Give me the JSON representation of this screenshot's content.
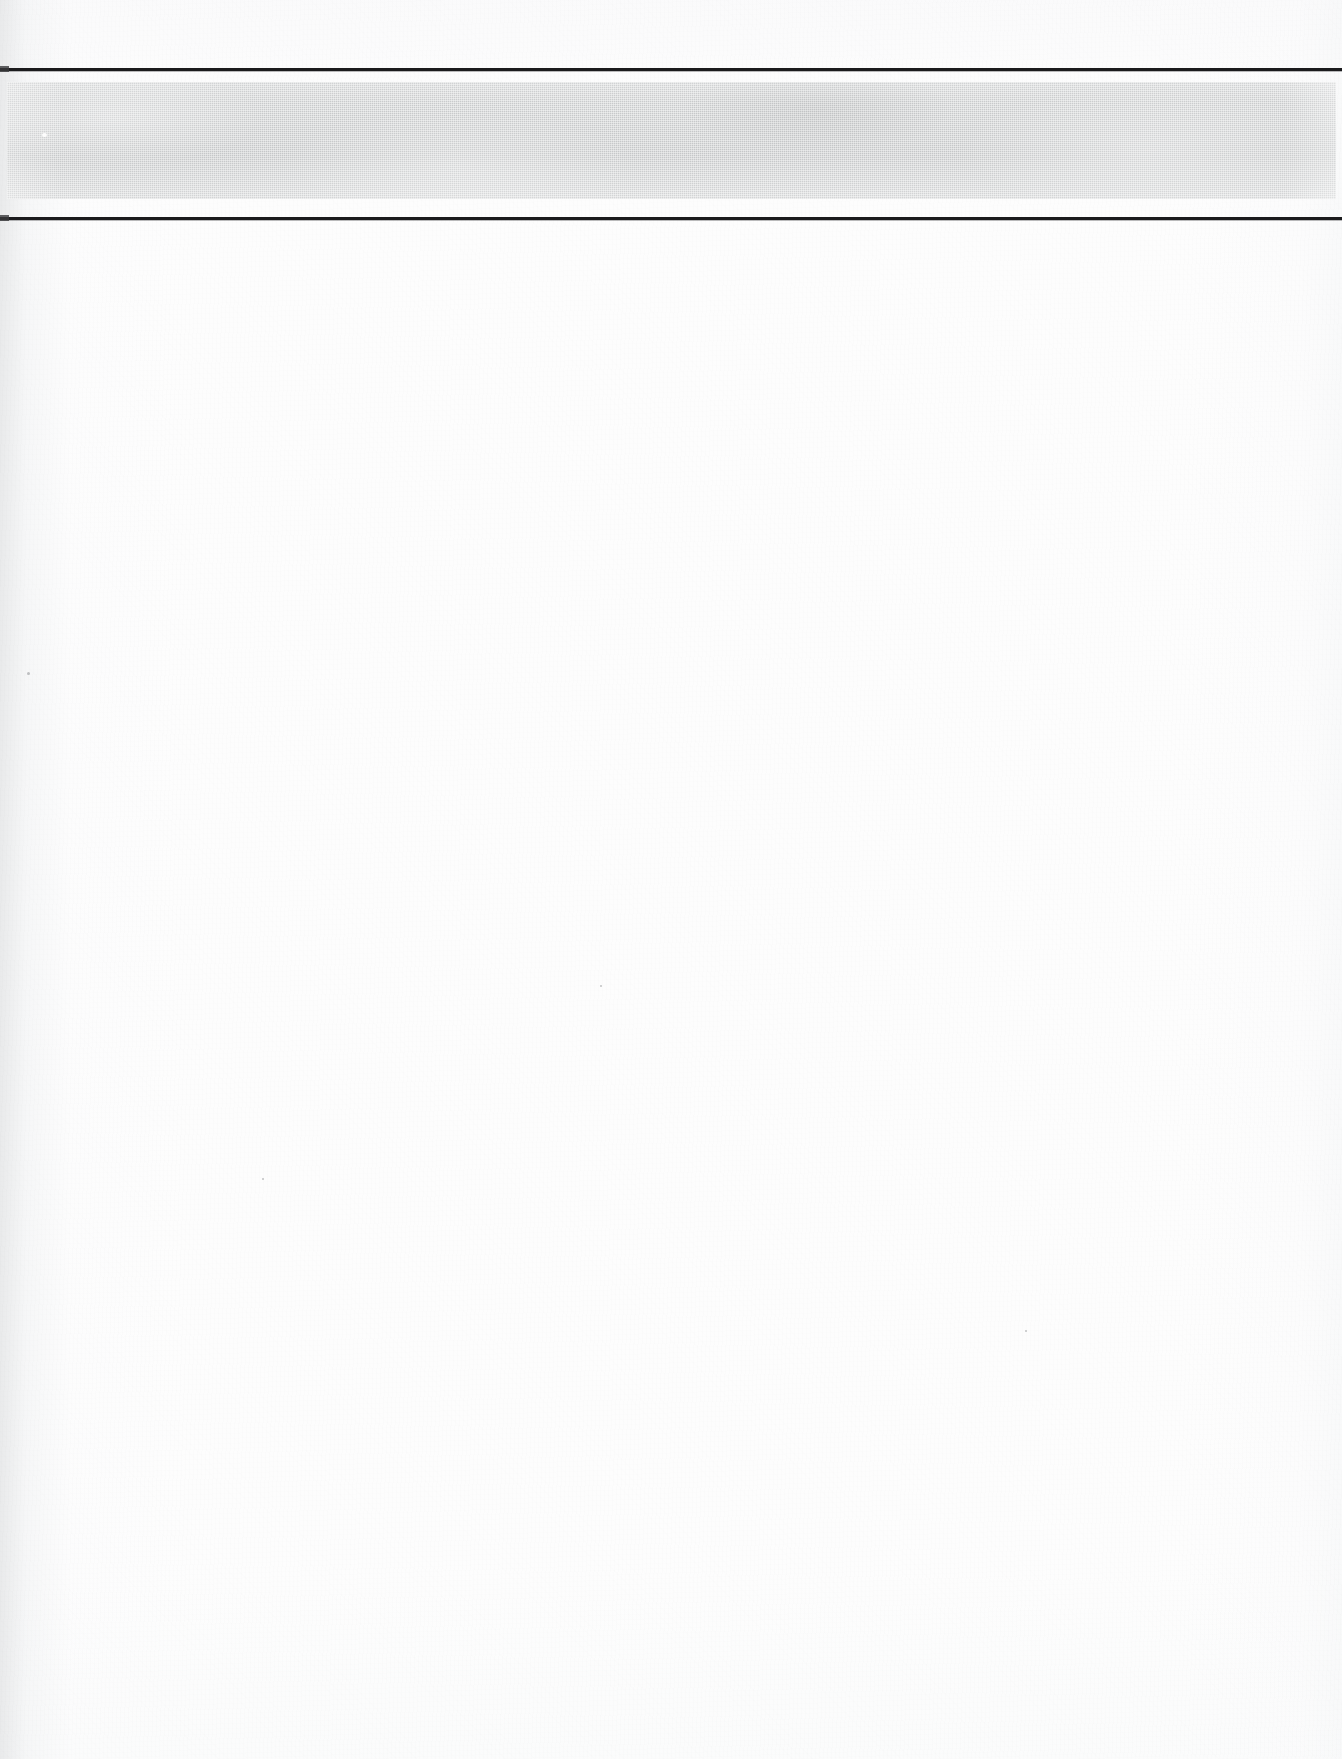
{
  "document": {
    "kind": "scanned-page",
    "page_width": 1342,
    "page_height": 1759,
    "background_color": "#fdfdfd",
    "body_text": ""
  },
  "header": {
    "rule_top": {
      "label": "",
      "color": "#1b1b1d",
      "thickness_px": 3,
      "top_px": 68
    },
    "tint_band": {
      "label": "",
      "color": "#c8cacb",
      "top_px": 82,
      "height_px": 117,
      "left_px": 7,
      "width_px": 1329,
      "screen": "halftone"
    },
    "rule_bottom": {
      "label": "",
      "color": "#1b1b1d",
      "thickness_px": 3,
      "top_px": 217
    }
  },
  "body": {
    "content": "",
    "note": ""
  },
  "artifacts": {
    "gutter_shadow_color": "#e8e9ea",
    "paper_tone": "#fefefe",
    "specks": [
      {
        "x": 27,
        "y": 672,
        "size": 3
      },
      {
        "x": 1025,
        "y": 1330,
        "size": 2
      },
      {
        "x": 600,
        "y": 985,
        "size": 2
      },
      {
        "x": 262,
        "y": 1178,
        "size": 2
      }
    ]
  }
}
